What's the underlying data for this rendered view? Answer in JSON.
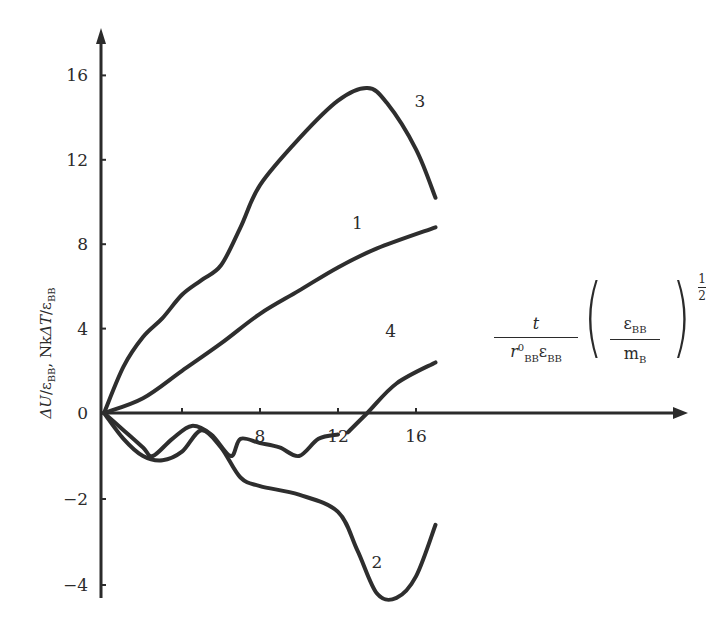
{
  "chart_data": {
    "type": "line",
    "title": "",
    "xlabel": "t / (r⁰_BB ε_BB) · (ε_BB / m_B)^(1/2)",
    "ylabel": "ΔU/ε_BB, NkΔT/ε_BB",
    "x_ticks": [
      4,
      8,
      12,
      16
    ],
    "x_tick_labels": [
      "",
      "8",
      "12",
      "16"
    ],
    "y_ticks": [
      16,
      12,
      8,
      4,
      0,
      -2,
      -4
    ],
    "y_tick_labels": [
      "16",
      "12",
      "8",
      "4",
      "0",
      "−2",
      "−4"
    ],
    "xlim": [
      0,
      30
    ],
    "ylim": [
      -4.3,
      17.5
    ],
    "grid": false,
    "legend": "inline curve numbers",
    "series": [
      {
        "name": "1",
        "x": [
          0,
          2,
          4,
          6,
          8,
          10,
          12,
          14,
          17
        ],
        "y": [
          0,
          0.7,
          2.0,
          3.3,
          4.7,
          5.8,
          6.9,
          7.8,
          8.8
        ]
      },
      {
        "name": "2",
        "x": [
          0,
          1,
          2,
          3,
          4,
          5,
          6,
          7,
          8,
          10,
          12,
          13,
          14,
          15,
          16,
          17
        ],
        "y": [
          0,
          -0.6,
          -1.0,
          -1.1,
          -0.9,
          -0.4,
          -0.8,
          -1.5,
          -1.7,
          -1.9,
          -2.3,
          -3.2,
          -4.2,
          -4.3,
          -3.8,
          -2.6
        ]
      },
      {
        "name": "3",
        "x": [
          0,
          1,
          2,
          3,
          4,
          5,
          6,
          7,
          8,
          10,
          12,
          13.5,
          14.5,
          16,
          17
        ],
        "y": [
          0,
          2.2,
          3.6,
          4.5,
          5.6,
          6.3,
          7.0,
          8.8,
          10.8,
          13.0,
          14.8,
          15.4,
          14.7,
          12.5,
          10.2
        ]
      },
      {
        "name": "4",
        "x": [
          0,
          1,
          2,
          2.5,
          3.5,
          4.5,
          5.5,
          6.5,
          7,
          8,
          9,
          10,
          11,
          12,
          null,
          12.5,
          13.5,
          15,
          17
        ],
        "y": [
          0,
          -0.4,
          -0.8,
          -1.0,
          -0.6,
          -0.3,
          -0.5,
          -1.0,
          -0.6,
          -0.7,
          -0.8,
          -1.0,
          -0.6,
          -0.5,
          null,
          -0.45,
          0,
          1.4,
          2.4
        ]
      }
    ],
    "curve_labels": [
      {
        "name": "1",
        "x": 13,
        "y": 8.7
      },
      {
        "name": "2",
        "x": 14,
        "y": -3.6
      },
      {
        "name": "3",
        "x": 16.2,
        "y": 14.5
      },
      {
        "name": "4",
        "x": 14.7,
        "y": 3.6
      }
    ],
    "note": "negative y-axis is drawn at approximately double scale"
  },
  "axis_labels": {
    "y_delta_u": "ΔU",
    "y_sub_bb_1": "BB",
    "y_sep": ", Nk",
    "y_delta_t": "ΔT",
    "y_sub_bb_2": "BB",
    "y_eps": "ε",
    "x_t": "t",
    "x_r": "r",
    "x_r_sup": "0",
    "x_r_sub": "BB",
    "x_eps": "ε",
    "x_eps_sub": "BB",
    "x_m": "m",
    "x_m_sub": "B",
    "x_exp_num": "1",
    "x_exp_den": "2"
  }
}
